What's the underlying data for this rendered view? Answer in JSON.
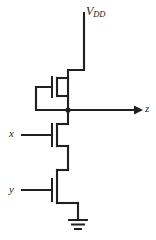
{
  "diagram": {
    "line_color": "#231f20",
    "background_color": "#ffffff"
  },
  "labels": {
    "supply": "V",
    "supply_subscript": "DD",
    "output": "z",
    "input_x": "x",
    "input_y": "y"
  },
  "components": [
    {
      "name": "load-transistor",
      "type": "depletion-nmos-load",
      "gate_connected_to": "source",
      "drain_connected_to": "V_DD",
      "source_connected_to": "z"
    },
    {
      "name": "transistor-x",
      "type": "nmos",
      "gate_input": "x",
      "drain_connected_to": "z",
      "source_connected_to": "transistor-y-drain"
    },
    {
      "name": "transistor-y",
      "type": "nmos",
      "gate_input": "y",
      "drain_connected_to": "transistor-x-source",
      "source_connected_to": "ground"
    }
  ],
  "nets": {
    "supply_rail": "V_DD",
    "output_node": "z",
    "ground_symbol": "earth-ground"
  }
}
